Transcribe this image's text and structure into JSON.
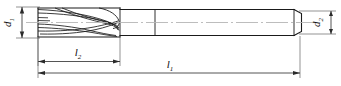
{
  "drawing": {
    "title": "End mill engineering drawing",
    "background_color": "#ffffff",
    "outline_color": "#1a1a1a",
    "centerline_color": "#b0b0b0",
    "dimension_color": "#2a2a2a",
    "dimensions": {
      "d1": {
        "symbol": "d",
        "subscript": "1",
        "orientation": "vertical",
        "side": "left"
      },
      "d2": {
        "symbol": "d",
        "subscript": "2",
        "orientation": "vertical",
        "side": "right"
      },
      "l2": {
        "symbol": "l",
        "subscript": "2",
        "orientation": "horizontal",
        "position": "upper"
      },
      "l1": {
        "symbol": "l",
        "subscript": "1",
        "orientation": "horizontal",
        "position": "lower"
      }
    },
    "features": {
      "flute_count_visible": 3,
      "cutting_section": "helical fluted cutting body",
      "shank_section": "cylindrical plain shank with end chamfer"
    }
  }
}
